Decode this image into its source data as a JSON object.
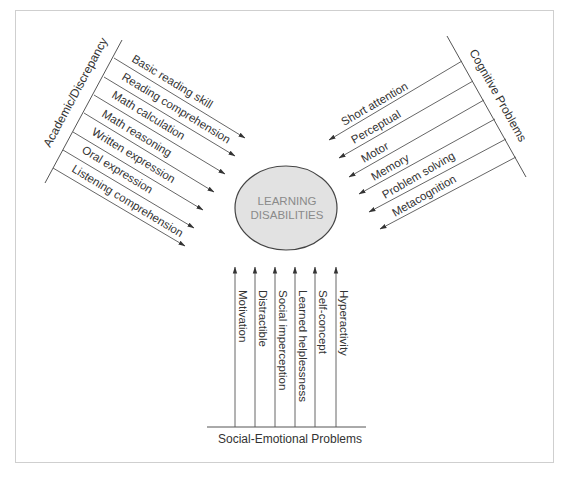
{
  "center": {
    "line1": "LEARNING",
    "line2": "DISABILITIES",
    "fill": "#e2e2e2",
    "stroke": "#444444"
  },
  "groups": {
    "academic": {
      "label": "Academic/Discrepancy",
      "items": [
        "Basic reading skill",
        "Reading comprehension",
        "Math calculation",
        "Math reasoning",
        "Written expression",
        "Oral expression",
        "Listening comprehension"
      ]
    },
    "cognitive": {
      "label": "Cognitive Problems",
      "items": [
        "Short attention",
        "Perceptual",
        "Motor",
        "Memory",
        "Problem solving",
        "Metacognition"
      ]
    },
    "social": {
      "label": "Social-Emotional Problems",
      "items": [
        "Motivation",
        "Distractible",
        "Social imperception",
        "Learned helplessness",
        "Self-concept",
        "Hyperactivity"
      ]
    }
  }
}
